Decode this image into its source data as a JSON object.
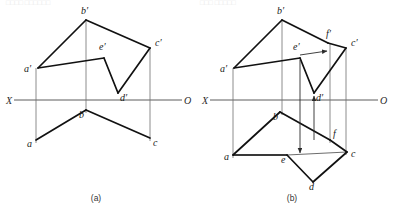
{
  "page": {
    "background": "#ffffff",
    "width": 394,
    "height": 217,
    "top_faint_text_left": "□□□□  □□□□□□",
    "top_faint_text_right": "□□□ □□□□□"
  },
  "colors": {
    "heavy_line": "#111111",
    "thin_line": "#3b3b3b",
    "projection_line": "#6e6e6e",
    "axis_line": "#4a4a4a",
    "label_text": "#1a1a1a",
    "caption_text": "#333333"
  },
  "figures": [
    {
      "id": "figure-a",
      "caption": "(a)",
      "caption_pos": {
        "x": 96,
        "y": 201
      },
      "axis": {
        "name": "projection-axis",
        "x1": 14,
        "y1": 100,
        "x2": 182,
        "y2": 100,
        "left_label": "X",
        "left_label_pos": {
          "x": 6,
          "y": 104
        },
        "right_label": "O",
        "right_label_pos": {
          "x": 184,
          "y": 104
        }
      },
      "points": [
        {
          "name": "b-prime",
          "label": "b′",
          "x": 86,
          "y": 20,
          "label_x": 81,
          "label_y": 14
        },
        {
          "name": "a-prime",
          "label": "a′",
          "x": 38,
          "y": 68,
          "label_x": 24,
          "label_y": 72
        },
        {
          "name": "c-prime",
          "label": "c′",
          "x": 150,
          "y": 48,
          "label_x": 155,
          "label_y": 46
        },
        {
          "name": "e-prime",
          "label": "e′",
          "x": 104,
          "y": 58,
          "label_x": 99,
          "label_y": 50
        },
        {
          "name": "d-prime",
          "label": "d′",
          "x": 118,
          "y": 93,
          "label_x": 120,
          "label_y": 101
        },
        {
          "name": "a-lower",
          "label": "a",
          "x": 36,
          "y": 140,
          "label_x": 27,
          "label_y": 147
        },
        {
          "name": "b-lower",
          "label": "b",
          "x": 86,
          "y": 110,
          "label_x": 79,
          "label_y": 118
        },
        {
          "name": "c-lower",
          "label": "c",
          "x": 150,
          "y": 138,
          "label_x": 153,
          "label_y": 146
        }
      ],
      "heavy_paths": [
        {
          "name": "edge-a-prime-b-prime",
          "d": "M 38 68 L 86 20"
        },
        {
          "name": "edge-b-prime-c-prime",
          "d": "M 86 20 L 150 48"
        },
        {
          "name": "edge-a-prime-e-prime",
          "d": "M 38 68 L 104 58"
        },
        {
          "name": "edge-e-prime-d-prime",
          "d": "M 104 58 L 118 93"
        },
        {
          "name": "edge-d-prime-c-prime",
          "d": "M 118 93 L 150 48"
        },
        {
          "name": "edge-a-b-lower",
          "d": "M 36 140 L 86 110"
        },
        {
          "name": "edge-b-c-lower",
          "d": "M 86 110 L 150 138"
        }
      ],
      "thin_paths": [],
      "projection_lines": [
        {
          "name": "projector-a",
          "d": "M 36 68 L 36 143"
        },
        {
          "name": "projector-b",
          "d": "M 86 20 L 86 113"
        },
        {
          "name": "projector-c",
          "d": "M 150 48 L 150 141"
        }
      ],
      "arrows": []
    },
    {
      "id": "figure-b",
      "caption": "(b)",
      "caption_pos": {
        "x": 292,
        "y": 201
      },
      "axis": {
        "name": "projection-axis",
        "x1": 210,
        "y1": 100,
        "x2": 378,
        "y2": 100,
        "left_label": "X",
        "left_label_pos": {
          "x": 202,
          "y": 104
        },
        "right_label": "O",
        "right_label_pos": {
          "x": 380,
          "y": 104
        }
      },
      "points": [
        {
          "name": "b-prime",
          "label": "b′",
          "x": 282,
          "y": 20,
          "label_x": 277,
          "label_y": 14
        },
        {
          "name": "a-prime",
          "label": "a′",
          "x": 234,
          "y": 68,
          "label_x": 220,
          "label_y": 72
        },
        {
          "name": "c-prime",
          "label": "c′",
          "x": 346,
          "y": 48,
          "label_x": 351,
          "label_y": 46
        },
        {
          "name": "e-prime",
          "label": "e′",
          "x": 300,
          "y": 58,
          "label_x": 293,
          "label_y": 50
        },
        {
          "name": "d-prime",
          "label": "d′",
          "x": 314,
          "y": 93,
          "label_x": 316,
          "label_y": 101
        },
        {
          "name": "f-prime",
          "label": "f′",
          "x": 328,
          "y": 43,
          "label_x": 326,
          "label_y": 37
        },
        {
          "name": "a-lower",
          "label": "a",
          "x": 233,
          "y": 155,
          "label_x": 224,
          "label_y": 160
        },
        {
          "name": "b-lower",
          "label": "b",
          "x": 280,
          "y": 112,
          "label_x": 273,
          "label_y": 120
        },
        {
          "name": "c-lower",
          "label": "c",
          "x": 347,
          "y": 152,
          "label_x": 351,
          "label_y": 157
        },
        {
          "name": "e-lower",
          "label": "e",
          "x": 287,
          "y": 155,
          "label_x": 281,
          "label_y": 163
        },
        {
          "name": "d-lower",
          "label": "d",
          "x": 313,
          "y": 182,
          "label_x": 309,
          "label_y": 190
        },
        {
          "name": "f-lower",
          "label": "f",
          "x": 330,
          "y": 140,
          "label_x": 333,
          "label_y": 137
        }
      ],
      "heavy_paths": [
        {
          "name": "edge-a-prime-b-prime",
          "d": "M 234 68 L 282 20"
        },
        {
          "name": "edge-b-prime-f-prime",
          "d": "M 282 20 L 328 43"
        },
        {
          "name": "edge-f-prime-c-prime",
          "d": "M 328 43 L 346 48"
        },
        {
          "name": "edge-a-prime-e-prime",
          "d": "M 234 68 L 300 58"
        },
        {
          "name": "edge-e-prime-d-prime",
          "d": "M 300 58 L 314 93"
        },
        {
          "name": "edge-d-prime-c-prime",
          "d": "M 314 93 L 346 48"
        },
        {
          "name": "edge-a-b-lower",
          "d": "M 233 155 L 280 112"
        },
        {
          "name": "edge-b-f-lower",
          "d": "M 280 112 L 330 140"
        },
        {
          "name": "edge-f-c-lower",
          "d": "M 330 140 L 347 152"
        },
        {
          "name": "edge-a-e-lower",
          "d": "M 233 155 L 287 155"
        },
        {
          "name": "edge-e-d-lower",
          "d": "M 287 155 L 313 182"
        },
        {
          "name": "edge-d-c-lower",
          "d": "M 313 182 L 347 152"
        }
      ],
      "thin_paths": [
        {
          "name": "auxiliary-line-e-f-lower",
          "d": "M 287 155 L 347 152"
        },
        {
          "name": "auxiliary-line-a-c-lower",
          "d": "M 233 155 L 287 155"
        }
      ],
      "projection_lines": [
        {
          "name": "projector-a",
          "d": "M 233 68 L 233 158"
        },
        {
          "name": "projector-b",
          "d": "M 282 20 L 282 115"
        },
        {
          "name": "projector-c",
          "d": "M 346 48 L 346 155"
        },
        {
          "name": "projector-f",
          "d": "M 330 43 L 330 143"
        }
      ],
      "arrows": [
        {
          "name": "arrow-e-prime-to-f-prime",
          "x1": 300,
          "y1": 55,
          "x2": 327,
          "y2": 51,
          "direction": "right"
        },
        {
          "name": "arrow-e-prime-down-to-e",
          "x1": 300,
          "y1": 60,
          "x2": 300,
          "y2": 153,
          "direction": "down"
        },
        {
          "name": "arrow-d-up-to-d-prime",
          "x1": 314,
          "y1": 140,
          "x2": 314,
          "y2": 96,
          "direction": "up"
        }
      ]
    }
  ]
}
